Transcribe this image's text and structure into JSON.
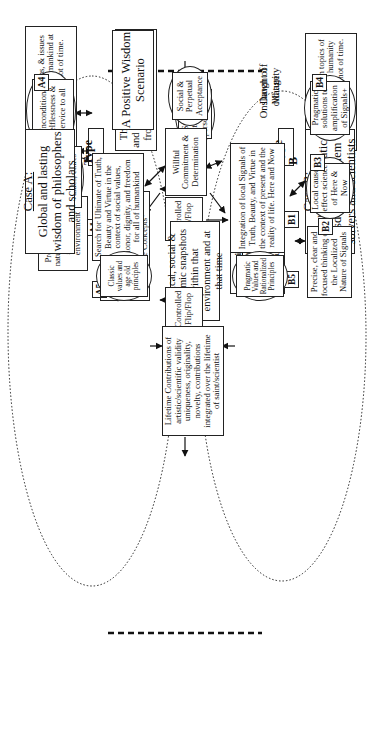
{
  "diagram": {
    "orientation": "rotated 90 degrees counter-clockwise",
    "case_a": {
      "heading": "Case A:",
      "text": "Global and lasting wisdom of philosophers and scholars"
    },
    "case_b": {
      "heading": "Case B:",
      "text": "Local and pragmatic wisdom of problem solvers and scientists"
    },
    "scenario_title": "A Positive Wisdom Scenario",
    "milestones": {
      "start": "Dawn of Maturity",
      "end": "Onslaught of old age"
    },
    "type_labels": {
      "a": "Type A",
      "b": "Type B"
    },
    "footnotes": {
      "asterisk": "* Concepts, concerns, & issues of importance for humankind at the current snapshot of time.",
      "signal_noise": "The notion of signal (S) and noise (N) are borrowed from Shannon's theories",
      "plus": "+ Signals originate in topics of vital importance for humanity at the current snapshot of time."
    },
    "start_nodes": {
      "attitude": "Strongest attitude & perseverance",
      "commitment": "Willful Commitment & Determination"
    },
    "center_nodes": {
      "flip_flop_left": "Controlled Flip/Flop",
      "environment": "Political, social & economic snapshots within that environment and at that time",
      "flip_flop_right": "Controlled Flip/Flop",
      "lifetime": "Lifetime Contributions of artistic/scientific validity uniqueness, originality, novelty, contributions integrated over the lifetime of saint/scientist",
      "acceptance": "Social & Perpetual Acceptance"
    },
    "type_a_nodes": [
      {
        "tag": "A1",
        "title": "Unrestrained + Wisdom",
        "text": "Capacity to dispel noise and contamination. Capacity to isolate the Purest & most Pristine Concepts*"
      },
      {
        "tag": "A2",
        "text": "Predisposition to nature, philosophy, science, and environment"
      },
      {
        "tag": "A3",
        "text": "Long lasting contributions truth, social values, ethics"
      },
      {
        "tag": "A4",
        "text": "Unconditional selflessness & service to all"
      },
      {
        "tag": "A5",
        "text": "Search for Ultimate of Truth, Beauty and Virtue in the context of social values, honor, dignity, and freedom for all of humankind"
      }
    ],
    "type_a_outcome": "Classic values and age old principles",
    "type_b_nodes": [
      {
        "tag": "B1",
        "title": "Restrained + Wisdom",
        "text": "Capacity to deal with Signals and Noise as integral part of reality and yet be able to isolate clusters of Signals+."
      },
      {
        "tag": "B2",
        "text": "Precise, clear and focused thinking on the Localized Nature of Signals"
      },
      {
        "tag": "B3",
        "text": "Local cause-effect science of Here & Now"
      },
      {
        "tag": "B4",
        "text": "Pragmatic solutions to amplification of Signals+"
      },
      {
        "tag": "B5",
        "text": "Integration of local Signals of Truth, Beauty, and Virtue in the context of present and the reality of life. Here and Now"
      }
    ],
    "type_b_outcome": "Pragmatic Values and Rationalized Principles"
  }
}
